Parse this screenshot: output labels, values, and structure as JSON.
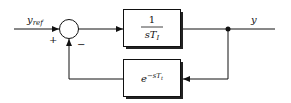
{
  "diagram": {
    "type": "feedback-control-block-diagram",
    "input_label": "y",
    "input_subscript": "ref",
    "output_label": "y",
    "summing_junction": {
      "plus_sign": "+",
      "minus_sign": "−"
    },
    "forward_block": {
      "numerator": "1",
      "denominator_main": "sT",
      "denominator_sub": "I"
    },
    "feedback_block": {
      "base": "e",
      "exponent_main": "−sT",
      "exponent_sub": "t"
    },
    "colors": {
      "line": "#111111",
      "background": "#ffffff"
    }
  }
}
